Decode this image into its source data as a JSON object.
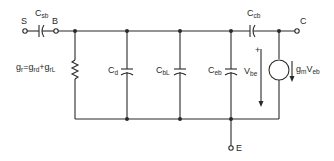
{
  "diagram": {
    "type": "small-signal equivalent circuit",
    "terminals": {
      "S": "S",
      "B": "B",
      "C": "C",
      "E": "E"
    },
    "components": {
      "csb": {
        "main": "C",
        "sub": "sb"
      },
      "ccb": {
        "main": "C",
        "sub": "cb"
      },
      "cd": {
        "main": "C",
        "sub": "d"
      },
      "cbl": {
        "main": "C",
        "sub": "bL"
      },
      "ceb": {
        "main": "C",
        "sub": "eb"
      },
      "vbe": {
        "main": "V",
        "sub": "be",
        "polarity": "+"
      },
      "gm": {
        "main": "g",
        "sub": "m",
        "main2": "V",
        "sub2": "eb"
      },
      "gr": {
        "g1": "g",
        "s1": "r",
        "eq": "=",
        "g2": "g",
        "s2": "rd",
        "plus": "+",
        "g3": "g",
        "s3": "rL"
      }
    },
    "colors": {
      "line": "#2a2a2a",
      "background": "#ffffff"
    }
  }
}
